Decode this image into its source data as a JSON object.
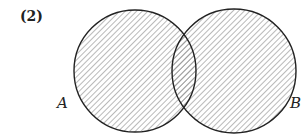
{
  "figure": {
    "number_label": "(2)",
    "type": "venn-diagram",
    "sets": [
      {
        "name": "A",
        "label": "A",
        "shaded": true
      },
      {
        "name": "B",
        "label": "B",
        "shaded": true
      }
    ],
    "shaded_region": "A ∪ B",
    "colors": {
      "stroke": "#222222",
      "hatch": "#8a8a8a",
      "background": "#ffffff"
    }
  }
}
